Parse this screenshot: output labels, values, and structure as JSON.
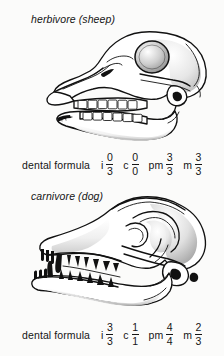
{
  "figure": {
    "background_color": "#fbfbfa",
    "ink_color": "#111111",
    "panels": [
      {
        "id": "herbivore",
        "caption": "herbivore (sheep)",
        "illustration": "sheep-skull-lateral-line-drawing",
        "formula": {
          "label": "dental formula",
          "groups": [
            {
              "abbr": "i",
              "upper": "0",
              "lower": "3"
            },
            {
              "abbr": "c",
              "upper": "0",
              "lower": "0"
            },
            {
              "abbr": "pm",
              "upper": "3",
              "lower": "3"
            },
            {
              "abbr": "m",
              "upper": "3",
              "lower": "3"
            }
          ]
        }
      },
      {
        "id": "carnivore",
        "caption": "carnivore (dog)",
        "illustration": "dog-skull-lateral-line-drawing",
        "formula": {
          "label": "dental formula",
          "groups": [
            {
              "abbr": "i",
              "upper": "3",
              "lower": "3"
            },
            {
              "abbr": "c",
              "upper": "1",
              "lower": "1"
            },
            {
              "abbr": "pm",
              "upper": "4",
              "lower": "4"
            },
            {
              "abbr": "m",
              "upper": "2",
              "lower": "3"
            }
          ]
        }
      }
    ]
  }
}
